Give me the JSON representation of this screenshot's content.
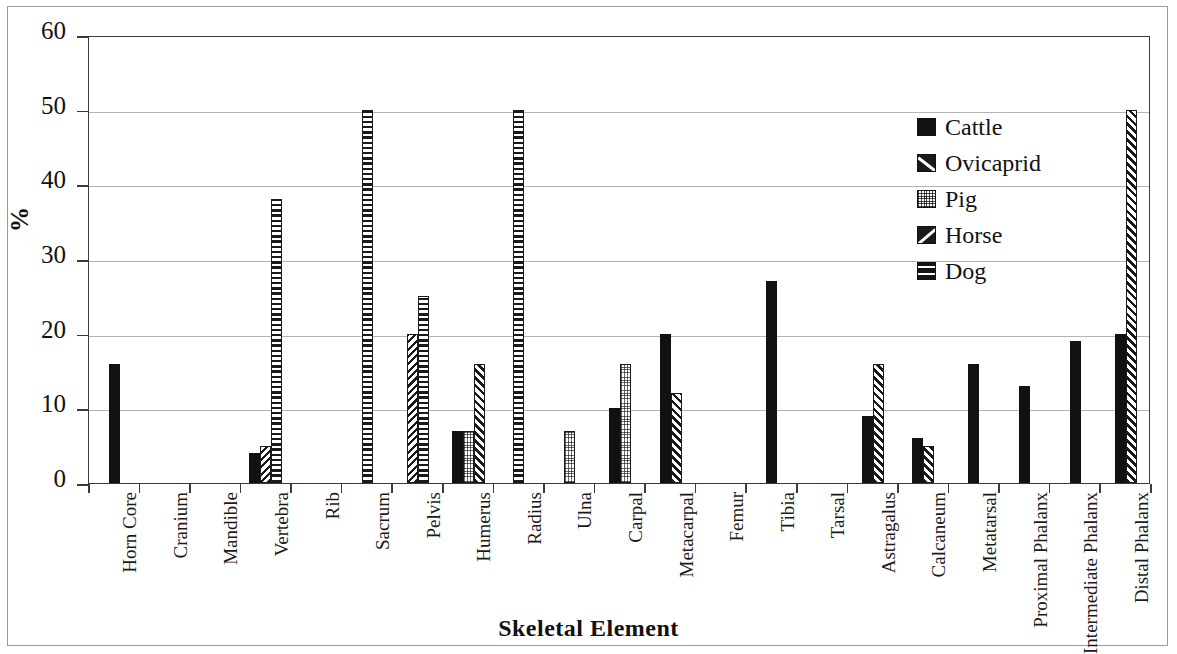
{
  "chart_data": {
    "type": "bar",
    "title": "",
    "xlabel": "Skeletal Element",
    "ylabel": "%",
    "ylim": [
      0,
      60
    ],
    "ytick_step": 10,
    "yticks": [
      60,
      50,
      40,
      30,
      20,
      10,
      0
    ],
    "grid": true,
    "legend_position": "top-right",
    "categories": [
      "Horn Core",
      "Cranium",
      "Mandible",
      "Vertebra",
      "Rib",
      "Sacrum",
      "Pelvis",
      "Humerus",
      "Radius",
      "Ulna",
      "Carpal",
      "Metacarpal",
      "Femur",
      "Tibia",
      "Tarsal",
      "Astragalus",
      "Calcaneum",
      "Metatarsal",
      "Proximal Phalanx",
      "Intermediate Phalanx",
      "Distal Phalanx"
    ],
    "series": [
      {
        "name": "Cattle",
        "pattern": "solid-black",
        "values": [
          16,
          0,
          0,
          4,
          0,
          0,
          0,
          7,
          0,
          0,
          10,
          20,
          0,
          27,
          0,
          9,
          6,
          16,
          13,
          19,
          20
        ]
      },
      {
        "name": "Ovicaprid",
        "pattern": "diagonal-hatch-down",
        "values": [
          0,
          0,
          0,
          5,
          0,
          0,
          20,
          0,
          0,
          0,
          0,
          0,
          0,
          0,
          0,
          0,
          0,
          0,
          0,
          0,
          0
        ]
      },
      {
        "name": "Pig",
        "pattern": "fine-grid",
        "values": [
          0,
          0,
          0,
          0,
          0,
          0,
          0,
          7,
          0,
          7,
          16,
          0,
          0,
          0,
          0,
          0,
          0,
          0,
          0,
          0,
          0
        ]
      },
      {
        "name": "Horse",
        "pattern": "diagonal-hatch-up",
        "values": [
          0,
          0,
          0,
          0,
          0,
          0,
          0,
          16,
          0,
          0,
          0,
          12,
          0,
          0,
          0,
          16,
          5,
          0,
          0,
          0,
          50
        ]
      },
      {
        "name": "Dog",
        "pattern": "horizontal-lines",
        "values": [
          0,
          0,
          0,
          38,
          0,
          50,
          25,
          0,
          50,
          0,
          0,
          0,
          0,
          0,
          0,
          0,
          0,
          0,
          0,
          0,
          0
        ]
      }
    ]
  },
  "legend": {
    "items": [
      {
        "label": "Cattle",
        "swatch": "sw-cattle"
      },
      {
        "label": "Ovicaprid",
        "swatch": "sw-ovicaprid"
      },
      {
        "label": "Pig",
        "swatch": "sw-pig"
      },
      {
        "label": "Horse",
        "swatch": "sw-horse"
      },
      {
        "label": "Dog",
        "swatch": "sw-dog"
      }
    ]
  },
  "colors": {
    "ink": "#111111",
    "axis": "#3b3b3b",
    "gridline": "#b4b4b4",
    "page_border": "#9a9a9a",
    "background": "#ffffff"
  }
}
